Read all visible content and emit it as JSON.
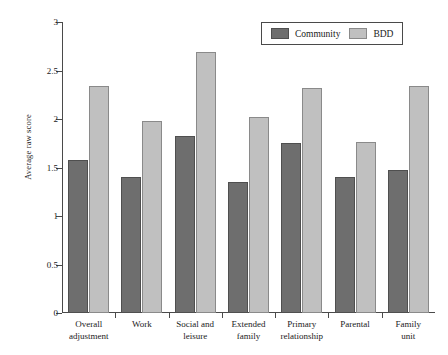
{
  "chart_data": {
    "type": "bar",
    "title": "",
    "xlabel": "",
    "ylabel": "Average raw score",
    "ylim": [
      0,
      3
    ],
    "yticks": [
      0,
      0.5,
      1,
      1.5,
      2,
      2.5,
      3
    ],
    "ytick_labels": [
      "0",
      "0.5",
      "1",
      "1.5",
      "2",
      "2.5",
      "3"
    ],
    "grid": false,
    "legend_position": "top-right",
    "categories": [
      "Overall adjustment",
      "Work",
      "Social and leisure",
      "Extended family",
      "Primary relationship",
      "Parental",
      "Family unit"
    ],
    "category_lines": [
      [
        "Overall",
        "adjustment"
      ],
      [
        "Work",
        ""
      ],
      [
        "Social and",
        "leisure"
      ],
      [
        "Extended",
        "family"
      ],
      [
        "Primary",
        "relationship"
      ],
      [
        "Parental",
        ""
      ],
      [
        "Family",
        "unit"
      ]
    ],
    "series": [
      {
        "name": "Community",
        "color": "#6e6e6e",
        "values": [
          1.58,
          1.4,
          1.83,
          1.35,
          1.75,
          1.4,
          1.47
        ]
      },
      {
        "name": "BDD",
        "color": "#c0c0c0",
        "values": [
          2.34,
          1.98,
          2.69,
          2.02,
          2.32,
          1.76,
          2.34
        ]
      }
    ]
  },
  "legend": {
    "entries": [
      {
        "label": "Community",
        "color": "#6e6e6e"
      },
      {
        "label": "BDD",
        "color": "#c0c0c0"
      }
    ]
  },
  "colors": {
    "community": "#6e6e6e",
    "bdd": "#c0c0c0",
    "axis": "#4a4a4a",
    "background": "#ffffff",
    "text": "#1a1a1a"
  }
}
